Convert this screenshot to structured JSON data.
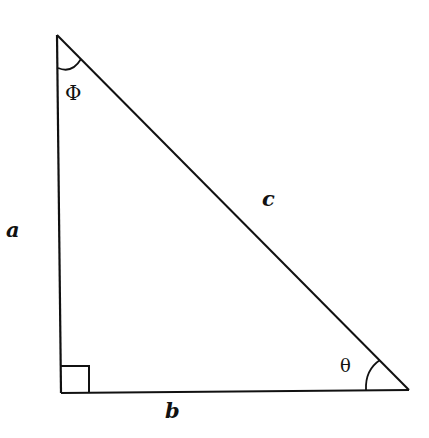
{
  "diagram": {
    "type": "right-triangle",
    "vertices": {
      "top": [
        57,
        35
      ],
      "bottom_left": [
        61,
        393
      ],
      "bottom_right": [
        409,
        390
      ]
    },
    "labels": {
      "side_a": "a",
      "side_b": "b",
      "side_c": "c",
      "angle_top": "Φ",
      "angle_right": "θ"
    },
    "right_angle_marker": true,
    "stroke_color": "#111111",
    "background": "#ffffff"
  }
}
